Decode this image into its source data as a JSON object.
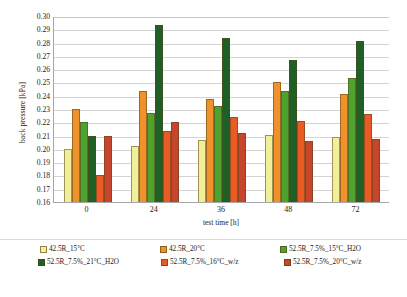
{
  "chart_data": {
    "type": "bar",
    "title": "",
    "xlabel": "test time [h]",
    "ylabel": "back pressure [kPa]",
    "categories": [
      "0",
      "24",
      "36",
      "48",
      "72"
    ],
    "ylim": [
      0.16,
      0.3
    ],
    "ytick_step": 0.01,
    "yticks": [
      "0.30",
      "0.29",
      "0.28",
      "0.27",
      "0.26",
      "0.25",
      "0.24",
      "0.23",
      "0.22",
      "0.21",
      "0.20",
      "0.19",
      "0.18",
      "0.17",
      "0.16"
    ],
    "grid": true,
    "legend_position": "bottom",
    "series": [
      {
        "name": "42.5R_15°C",
        "color": "#f2ef9b",
        "values": [
          0.2,
          0.202,
          0.207,
          0.2105,
          0.209
        ]
      },
      {
        "name": "42.5R_20°C",
        "color": "#f0922b",
        "values": [
          0.23,
          0.2435,
          0.2375,
          0.2505,
          0.241
        ]
      },
      {
        "name": "52.5R_7.5%_15°C_H2O",
        "color": "#4ea32f",
        "values": [
          0.22,
          0.227,
          0.2325,
          0.2435,
          0.253
        ]
      },
      {
        "name": "52.5R_7.5%_21°C_H2O",
        "color": "#1f6027",
        "values": [
          0.21,
          0.2935,
          0.2835,
          0.267,
          0.281
        ]
      },
      {
        "name": "52.5R_7.5%_16°C_w/z",
        "color": "#ec5a24",
        "values": [
          0.18,
          0.2135,
          0.224,
          0.221,
          0.226
        ]
      },
      {
        "name": "52.5R_7.5%_20°C_w/z",
        "color": "#c6452c",
        "values": [
          0.21,
          0.2205,
          0.212,
          0.206,
          0.2075
        ]
      }
    ]
  }
}
